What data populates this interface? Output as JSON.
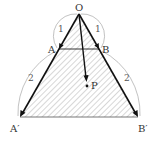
{
  "figure": {
    "points": {
      "O": {
        "label": "O",
        "x": 79,
        "y": 14
      },
      "A": {
        "label": "A",
        "x": 59,
        "y": 49
      },
      "B": {
        "label": "B",
        "x": 99,
        "y": 49
      },
      "A_prime": {
        "label": "A′",
        "x": 20,
        "y": 117
      },
      "B_prime": {
        "label": "B′",
        "x": 138,
        "y": 117
      },
      "P": {
        "label": "P",
        "x": 87,
        "y": 86
      }
    },
    "lengths": {
      "OA": "1",
      "OB": "1",
      "AA_prime": "2",
      "BB_prime": "2"
    },
    "colors": {
      "stroke": "#222222",
      "hatch": "#888888",
      "arc": "#999999"
    }
  }
}
